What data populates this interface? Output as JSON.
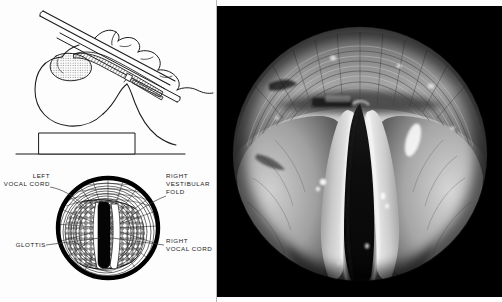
{
  "figure": {
    "background_color": "#ffffff",
    "panels": [
      "technique-diagram",
      "glottis-diagram",
      "laryngoscopic-photograph"
    ]
  },
  "left_panel": {
    "background_color": "#fdfdfd",
    "divider_color": "#b9b9b9",
    "upper_diagram": {
      "name": "laryngoscopy-technique-diagram",
      "description": "Lateral view of head and neck with laryngoscope blade inserted, head supported on a pillow block",
      "line_color": "#1a1a1a",
      "parts": [
        "laryngoscope-handle",
        "laryngoscope-blade",
        "hand",
        "head-outline",
        "tongue",
        "epiglottis",
        "pillow-block",
        "table-surface"
      ]
    },
    "lower_diagram": {
      "name": "glottis-view-diagram",
      "description": "Circular laryngoscopic view of the glottis showing vocal cords and vestibular folds",
      "ring_color": "#000000",
      "glottis_color": "#000000",
      "labels": [
        {
          "id": "left-vocal-cord",
          "line1": "LEFT",
          "line2": "VOCAL CORD",
          "side": "left",
          "anchor": "end"
        },
        {
          "id": "right-vestibular-fold",
          "line1": "RIGHT",
          "line2": "VESTIBULAR",
          "line3": "FOLD",
          "side": "right",
          "anchor": "start"
        },
        {
          "id": "glottis",
          "line1": "GLOTTIS",
          "side": "left",
          "anchor": "end"
        },
        {
          "id": "right-vocal-cord",
          "line1": "RIGHT",
          "line2": "VOCAL CORD",
          "side": "right",
          "anchor": "start"
        }
      ]
    }
  },
  "right_panel": {
    "name": "laryngoscopic-photograph",
    "background_color": "#000000",
    "description": "Grayscale endoscopic photograph of the larynx; circular field of view showing the vocal cords and the dark triangular glottic opening",
    "modality": "endoscopic photograph",
    "color_mode": "grayscale",
    "field_shape": "circular",
    "features": [
      "vocal-cords",
      "glottic-opening",
      "vestibular-folds",
      "tracheal-rings",
      "arytenoid-region",
      "light-reflection"
    ]
  }
}
